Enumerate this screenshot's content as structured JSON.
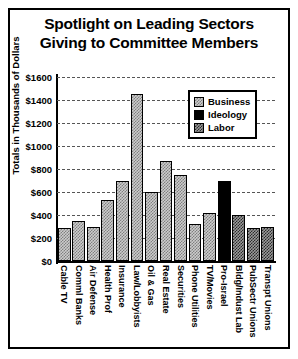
{
  "chart_data": {
    "type": "bar",
    "title": "Spotlight on Leading Sectors Giving to Committee Members",
    "title_line1": "Spotlight on Leading Sectors",
    "title_line2": "Giving to Committee Members",
    "xlabel": "",
    "ylabel": "Totals in Thousands of Dollars",
    "ylim": [
      0,
      1600
    ],
    "ytick_labels": [
      "$1600",
      "$1400",
      "$1200",
      "$1000",
      "$800",
      "$600",
      "$400",
      "$200",
      "$0"
    ],
    "ytick_values": [
      1600,
      1400,
      1200,
      1000,
      800,
      600,
      400,
      200,
      0
    ],
    "grid": true,
    "legend_position": "upper right",
    "categories": [
      "Cable TV",
      "Comml Banks",
      "Air Defense",
      "Health Prof",
      "Insurance",
      "Law/Lobbyists",
      "Oil & Gas",
      "Real Estate",
      "Securities",
      "Phone Utilities",
      "TV/Movies",
      "Pro-Israel",
      "Bldg/Indust Lab",
      "PubSectr Unions",
      "Transpt Unions"
    ],
    "values": [
      290,
      350,
      300,
      530,
      700,
      1450,
      600,
      870,
      750,
      320,
      420,
      700,
      400,
      290,
      300
    ],
    "groups": [
      "Business",
      "Business",
      "Business",
      "Business",
      "Business",
      "Business",
      "Business",
      "Business",
      "Business",
      "Business",
      "Business",
      "Ideology",
      "Labor",
      "Labor",
      "Labor"
    ],
    "legend": [
      {
        "label": "Business",
        "pattern": "pat-business"
      },
      {
        "label": "Ideology",
        "pattern": "pat-ideology"
      },
      {
        "label": "Labor",
        "pattern": "pat-labor"
      }
    ],
    "colors": {
      "business": "#cccccc",
      "ideology": "#000000",
      "labor": "#9a9a9a",
      "axis": "#000000",
      "background": "#ffffff"
    }
  }
}
